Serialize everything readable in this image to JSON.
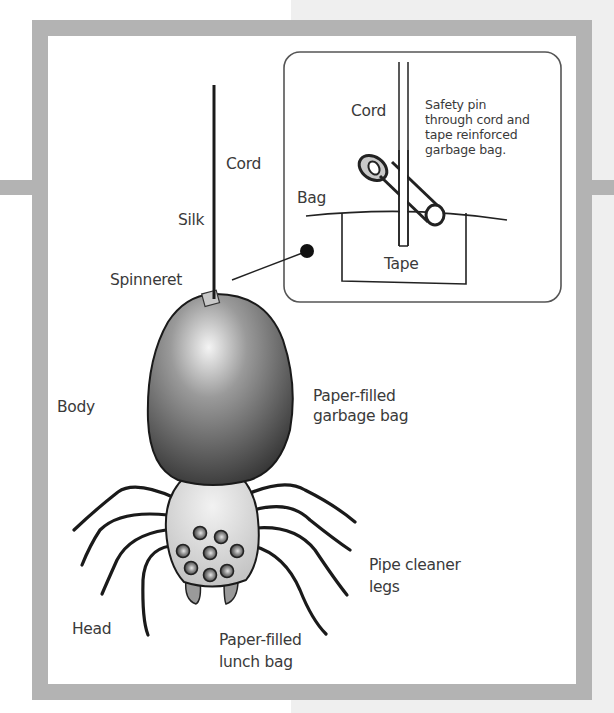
{
  "diagram": {
    "colors": {
      "frame": "#b3b3b3",
      "background_panel": "#efefef",
      "body_dark": "#3d3d3d",
      "head_light": "#d8d8d8",
      "line": "#1a1a1a",
      "text": "#3a3a3a"
    },
    "labels": {
      "cord": "Cord",
      "silk": "Silk",
      "spinneret": "Spinneret",
      "body": "Body",
      "body_desc_line1": "Paper-filled",
      "body_desc_line2": "garbage bag",
      "legs_line1": "Pipe cleaner",
      "legs_line2": "legs",
      "head": "Head",
      "head_desc_line1": "Paper-filled",
      "head_desc_line2": "lunch bag"
    },
    "inset": {
      "cord": "Cord",
      "bag": "Bag",
      "tape": "Tape",
      "note_line1": "Safety pin",
      "note_line2": "through cord and",
      "note_line3": "tape reinforced",
      "note_line4": "garbage bag."
    }
  }
}
